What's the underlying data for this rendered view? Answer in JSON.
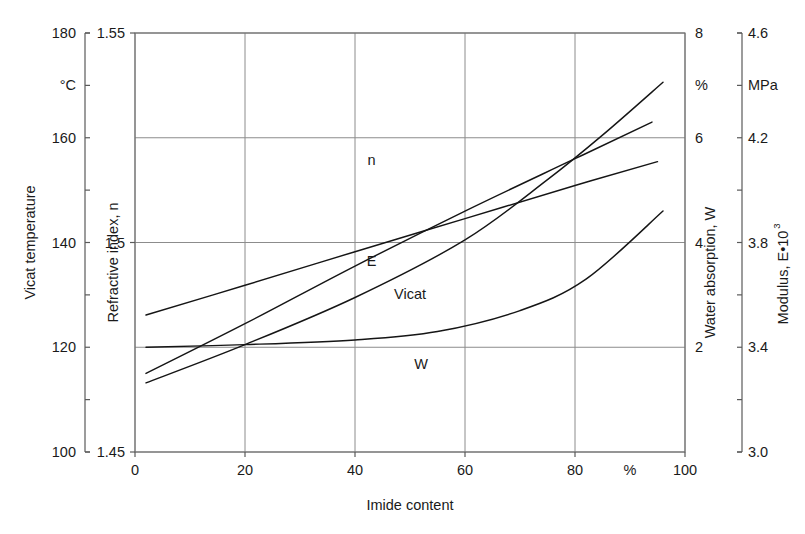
{
  "chart_data": {
    "type": "line",
    "title": "",
    "xlabel": "Imide content",
    "x_unit": "%",
    "xlim": [
      0,
      100
    ],
    "x_ticks": [
      0,
      20,
      40,
      60,
      80,
      100
    ],
    "x_tick_labels": [
      "0",
      "20",
      "40",
      "60",
      "80",
      "100"
    ],
    "grid": true,
    "legend": "inline-curve-labels",
    "axes": [
      {
        "id": "vicat-temp",
        "title": "Vicat temperature",
        "unit": "°C",
        "side": "left",
        "position": 1,
        "lim": [
          100,
          180
        ],
        "ticks": [
          100,
          110,
          120,
          130,
          140,
          150,
          160,
          170,
          180
        ],
        "tick_labels": [
          "100",
          "",
          "120",
          "",
          "140",
          "",
          "160",
          "°C",
          "180"
        ]
      },
      {
        "id": "refractive-index",
        "title": "Refractive index, n",
        "unit": "",
        "side": "left",
        "position": 2,
        "lim": [
          1.45,
          1.55
        ],
        "ticks": [
          1.45,
          1.5,
          1.55
        ],
        "tick_labels": [
          "1.45",
          "1.5",
          "1.55"
        ]
      },
      {
        "id": "water-absorption",
        "title": "Water absorption, W",
        "unit": "%",
        "side": "right",
        "position": 1,
        "lim": [
          0,
          8
        ],
        "ticks": [
          0,
          2,
          4,
          6,
          7,
          8
        ],
        "tick_labels": [
          "",
          "2",
          "4",
          "6",
          "%",
          "8"
        ]
      },
      {
        "id": "modulus",
        "title": "Modulus, E•10",
        "title_superscript": "3",
        "unit": "MPa",
        "side": "right",
        "position": 2,
        "lim": [
          3.0,
          4.6
        ],
        "ticks": [
          3.0,
          3.2,
          3.4,
          3.6,
          3.8,
          4.0,
          4.2,
          4.4,
          4.6
        ],
        "tick_labels": [
          "3.0",
          "",
          "3.4",
          "",
          "3.8",
          "",
          "4.2",
          "MPa",
          "4.6"
        ]
      }
    ],
    "series": [
      {
        "name": "n",
        "label": "n",
        "axis": "refractive-index",
        "label_pos": {
          "x": 43,
          "y_frac": 0.685
        },
        "points": [
          {
            "x": 2,
            "y": 1.4827
          },
          {
            "x": 20,
            "y": 1.4898
          },
          {
            "x": 40,
            "y": 1.4978
          },
          {
            "x": 60,
            "y": 1.5057
          },
          {
            "x": 80,
            "y": 1.5136
          },
          {
            "x": 95,
            "y": 1.5193
          }
        ]
      },
      {
        "name": "E",
        "label": "E",
        "axis": "modulus",
        "label_pos": {
          "x": 43,
          "y_frac": 0.445
        },
        "points": [
          {
            "x": 2,
            "y": 3.3
          },
          {
            "x": 20,
            "y": 3.49
          },
          {
            "x": 40,
            "y": 3.71
          },
          {
            "x": 60,
            "y": 3.92
          },
          {
            "x": 80,
            "y": 4.12
          },
          {
            "x": 94,
            "y": 4.26
          }
        ]
      },
      {
        "name": "Vicat",
        "label": "Vicat",
        "axis": "vicat-temp",
        "label_pos": {
          "x": 50,
          "y_frac": 0.365
        },
        "points": [
          {
            "x": 2,
            "y": 113.2
          },
          {
            "x": 20,
            "y": 120.5
          },
          {
            "x": 40,
            "y": 129.5
          },
          {
            "x": 60,
            "y": 140.5
          },
          {
            "x": 75,
            "y": 152.0
          },
          {
            "x": 85,
            "y": 160.5
          },
          {
            "x": 96,
            "y": 170.6
          }
        ]
      },
      {
        "name": "W",
        "label": "W",
        "axis": "water-absorption",
        "label_pos": {
          "x": 52,
          "y_frac": 0.198
        },
        "points": [
          {
            "x": 2,
            "y": 2.0
          },
          {
            "x": 20,
            "y": 2.05
          },
          {
            "x": 40,
            "y": 2.14
          },
          {
            "x": 55,
            "y": 2.3
          },
          {
            "x": 70,
            "y": 2.7
          },
          {
            "x": 82,
            "y": 3.3
          },
          {
            "x": 96,
            "y": 4.6
          }
        ]
      }
    ]
  }
}
